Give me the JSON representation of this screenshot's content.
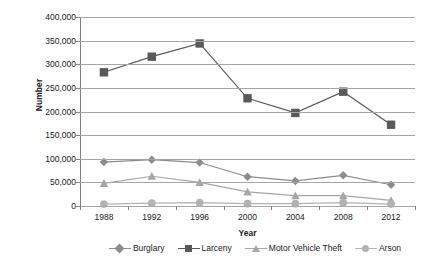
{
  "chart_data": {
    "type": "line",
    "title": "",
    "xlabel": "Year",
    "ylabel": "Number",
    "categories": [
      "1988",
      "1992",
      "1996",
      "2000",
      "2004",
      "2008",
      "2012"
    ],
    "ylim": [
      0,
      400000
    ],
    "ytick_values": [
      0,
      50000,
      100000,
      150000,
      200000,
      250000,
      300000,
      350000,
      400000
    ],
    "ytick_labels": [
      "0",
      "50,000",
      "100,000",
      "150,000",
      "200,000",
      "250,000",
      "300,000",
      "350,000",
      "400,000"
    ],
    "grid": true,
    "legend_position": "bottom",
    "series": [
      {
        "name": "Burglary",
        "marker": "diamond",
        "color": "#8c8c8c",
        "values": [
          93000,
          98000,
          92000,
          62000,
          53000,
          65000,
          45000
        ]
      },
      {
        "name": "Larceny",
        "marker": "square",
        "color": "#595959",
        "values": [
          283000,
          316000,
          344000,
          228000,
          197000,
          242000,
          172000
        ]
      },
      {
        "name": "Motor Vehicle Theft",
        "marker": "triangle",
        "color": "#a6a6a6",
        "values": [
          48000,
          63000,
          50000,
          30000,
          22000,
          22000,
          12000
        ]
      },
      {
        "name": "Arson",
        "marker": "circle",
        "color": "#b3b3b3",
        "values": [
          4000,
          6000,
          7000,
          5000,
          5000,
          7000,
          4000
        ]
      }
    ]
  },
  "axes": {
    "y_title": "Number",
    "x_title": "Year"
  },
  "colors": {
    "gridline": "#a6a6a6",
    "axis": "#595959",
    "text": "#1a1a1a",
    "background": "#ffffff"
  }
}
